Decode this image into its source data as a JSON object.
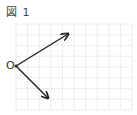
{
  "figure": {
    "title": "図 1",
    "origin_label": "O",
    "grid": {
      "cols": 10,
      "rows": 8,
      "color": "#c8c8c8"
    },
    "vectors": [
      {
        "name": "upper-vector",
        "dx": 4.5,
        "dy": -3
      },
      {
        "name": "lower-vector",
        "dx": 3,
        "dy": 3
      }
    ],
    "colors": {
      "arrow": "#222222",
      "text": "#444444"
    }
  }
}
